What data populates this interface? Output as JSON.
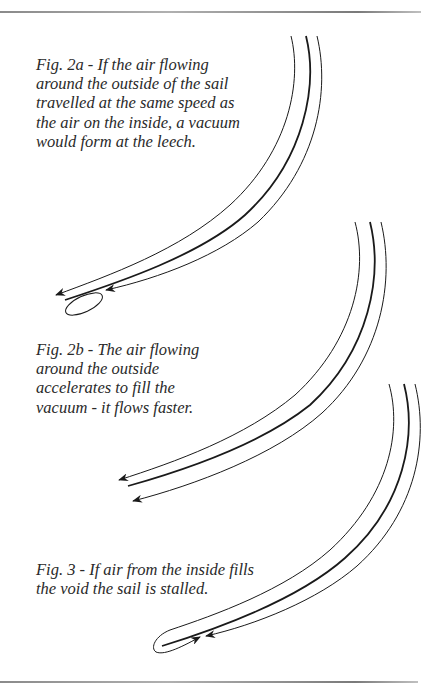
{
  "figures": [
    {
      "id": "fig-2a",
      "caption_lines": [
        "Fig. 2a - If the air flowing",
        "around the outside of the sail",
        "travelled at the same speed as",
        "the air on the inside, a vacuum",
        "would form at the leech."
      ]
    },
    {
      "id": "fig-2b",
      "caption_lines": [
        "Fig. 2b - The air flowing",
        "around the outside",
        "accelerates to fill the",
        "vacuum - it flows faster."
      ]
    },
    {
      "id": "fig-3",
      "caption_lines": [
        "Fig. 3 - If air from the inside fills",
        "the void the sail is stalled."
      ]
    }
  ],
  "colors": {
    "line": "#1a1a1a",
    "text": "#2a2a2a",
    "rule": "#8a8a8a"
  }
}
